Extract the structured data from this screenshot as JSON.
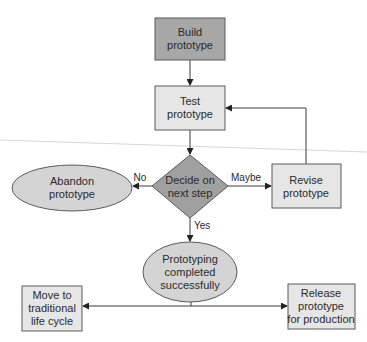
{
  "diagram": {
    "type": "flowchart",
    "colors": {
      "dark_fill": "#a7a7a7",
      "light_fill": "#e6e6e6",
      "ellipse_fill": "#d4d4d4",
      "stroke": "#5a5a5a",
      "line": "#3a3a3a"
    },
    "nodes": {
      "build": {
        "shape": "rect",
        "lines": [
          "Build",
          "prototype"
        ]
      },
      "test": {
        "shape": "rect",
        "lines": [
          "Test",
          "prototype"
        ]
      },
      "decide": {
        "shape": "diamond",
        "lines": [
          "Decide on",
          "next step"
        ]
      },
      "abandon": {
        "shape": "ellipse",
        "lines": [
          "Abandon",
          "prototype"
        ]
      },
      "revise": {
        "shape": "rect",
        "lines": [
          "Revise",
          "prototype"
        ]
      },
      "completed": {
        "shape": "ellipse",
        "lines": [
          "Prototyping",
          "completed",
          "successfully"
        ]
      },
      "traditional": {
        "shape": "rect",
        "lines": [
          "Move to",
          "traditional",
          "life cycle"
        ]
      },
      "release": {
        "shape": "rect",
        "lines": [
          "Release",
          "prototype",
          "for production"
        ]
      }
    },
    "edges": {
      "build_to_test": {
        "from": "build",
        "to": "test",
        "label": ""
      },
      "test_to_decide": {
        "from": "test",
        "to": "decide",
        "label": ""
      },
      "decide_to_abandon": {
        "from": "decide",
        "to": "abandon",
        "label": "No"
      },
      "decide_to_revise": {
        "from": "decide",
        "to": "revise",
        "label": "Maybe"
      },
      "decide_to_completed": {
        "from": "decide",
        "to": "completed",
        "label": "Yes"
      },
      "revise_to_test": {
        "from": "revise",
        "to": "test",
        "label": ""
      },
      "completed_to_traditional": {
        "from": "completed",
        "to": "traditional",
        "label": ""
      },
      "completed_to_release": {
        "from": "completed",
        "to": "release",
        "label": ""
      }
    }
  }
}
